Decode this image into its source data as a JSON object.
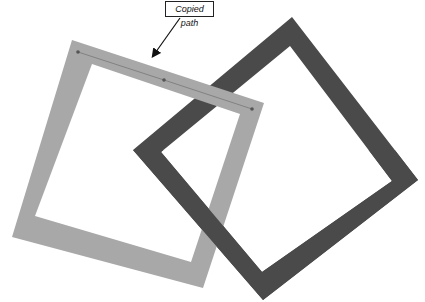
{
  "callout": {
    "label": "Copied path"
  },
  "shapes": {
    "light_square": {
      "color": "#a8a8a8",
      "outer": [
        [
          72,
          40
        ],
        [
          264,
          103
        ],
        [
          203,
          288
        ],
        [
          12,
          237
        ]
      ],
      "inner": [
        [
          92,
          64
        ],
        [
          240,
          114
        ],
        [
          191,
          262
        ],
        [
          35,
          216
        ]
      ]
    },
    "dark_square": {
      "color": "#4a4a4a",
      "outer": [
        [
          292,
          17
        ],
        [
          418,
          180
        ],
        [
          263,
          300
        ],
        [
          133,
          150
        ]
      ],
      "inner": [
        [
          290,
          46
        ],
        [
          392,
          181
        ],
        [
          262,
          272
        ],
        [
          161,
          152
        ]
      ]
    },
    "copied_path": {
      "color": "#666666",
      "points": [
        [
          78,
          52
        ],
        [
          164,
          80
        ],
        [
          252,
          109
        ]
      ]
    }
  },
  "arrow": {
    "from": [
      180,
      18
    ],
    "to": [
      152,
      58
    ],
    "color": "#111111"
  }
}
